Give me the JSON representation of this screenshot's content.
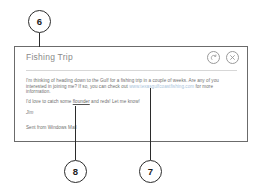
{
  "figure": {
    "callouts": [
      {
        "id": "6",
        "label": "6"
      },
      {
        "id": "7",
        "label": "7"
      },
      {
        "id": "8",
        "label": "8"
      }
    ]
  },
  "panel": {
    "title": "Fishing Trip",
    "actions": [
      {
        "name": "respond-icon",
        "label": "Respond"
      },
      {
        "name": "close-icon",
        "label": "Close"
      }
    ],
    "body": {
      "paragraph_1_part_1": "I'm thinking of heading down to the Gulf for a fishing trip in a couple of weeks. Are any of you interested in joining me? If so, you can check out ",
      "paragraph_1_link": "www.texasgulfcoastfishing.com",
      "paragraph_1_part_2": " for more information.",
      "paragraph_2_part_1": "I'd love to catch some ",
      "paragraph_2_misspelled": "flounder",
      "paragraph_2_part_2": " and reds! Let me know!",
      "signature": "Jim",
      "footer": "Sent from Windows Mail"
    }
  }
}
